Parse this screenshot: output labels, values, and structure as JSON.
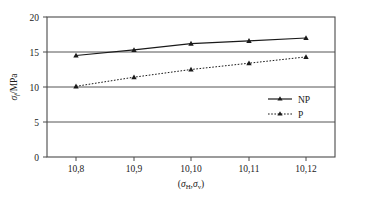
{
  "chart_data": {
    "type": "line",
    "title": "",
    "xlabel": "(σH,σv)",
    "ylabel": "σf/MPa",
    "categories": [
      "10,8",
      "10,9",
      "10,10",
      "10,11",
      "10,12"
    ],
    "ylim": [
      0,
      20
    ],
    "yticks": [
      0,
      5,
      10,
      15,
      20
    ],
    "ytick_labels": [
      "0",
      "5",
      "10",
      "15",
      "20"
    ],
    "grid": "horizontal",
    "legend_position": "center-right",
    "series": [
      {
        "name": "NP",
        "values": [
          14.5,
          15.3,
          16.2,
          16.6,
          17.0
        ],
        "line_style": "solid",
        "marker": "triangle",
        "color": "#1a1a1a"
      },
      {
        "name": "P",
        "values": [
          10.1,
          11.4,
          12.5,
          13.4,
          14.3
        ],
        "line_style": "dotted",
        "marker": "triangle",
        "color": "#1a1a1a"
      }
    ]
  },
  "axes": {
    "y_tick_0": "0",
    "y_tick_1": "5",
    "y_tick_2": "10",
    "y_tick_3": "15",
    "y_tick_4": "20",
    "x_tick_0": "10,8",
    "x_tick_1": "10,9",
    "x_tick_2": "10,10",
    "x_tick_3": "10,11",
    "x_tick_4": "10,12",
    "y_title_sigma": "σ",
    "y_title_sub": "f",
    "y_title_unit": "/MPa",
    "x_title_open": "(",
    "x_title_sigma1": "σ",
    "x_title_sub1": "H",
    "x_title_comma": ",",
    "x_title_sigma2": "σ",
    "x_title_sub2": "v",
    "x_title_close": ")"
  },
  "legend": {
    "entry_np": "NP",
    "entry_p": "P"
  },
  "style": {
    "frame_color": "#4a4a4a",
    "grid_color": "#555555",
    "series_color": "#1a1a1a",
    "background": "#ffffff"
  }
}
